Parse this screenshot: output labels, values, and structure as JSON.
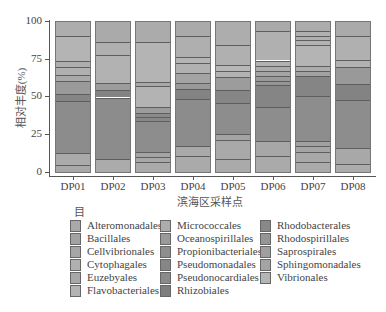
{
  "chart_data": {
    "type": "bar",
    "stacked": true,
    "title": "",
    "xlabel": "滨海区采样点",
    "ylabel": "相对丰度(%)",
    "ylim": [
      0,
      100
    ],
    "yticks": [
      0,
      25,
      50,
      75,
      100
    ],
    "grid": false,
    "legend_title": "目",
    "legend_position": "bottom",
    "categories": [
      "DP01",
      "DP02",
      "DP03",
      "DP04",
      "DP05",
      "DP06",
      "DP07",
      "DP08"
    ],
    "segment_boundaries_percent_bottom_to_top": {
      "DP01": [
        0,
        5,
        13,
        48,
        52.5,
        61,
        65,
        70,
        74,
        91,
        100
      ],
      "DP02": [
        0,
        9.5,
        50,
        55,
        59.5,
        78,
        86.5,
        100
      ],
      "DP03": [
        0,
        7,
        10.5,
        14,
        34.5,
        37,
        40,
        43.5,
        57.5,
        60.5,
        87,
        100
      ],
      "DP04": [
        0,
        11,
        18,
        49,
        55.5,
        59.5,
        66,
        73,
        76.5,
        90.5,
        100
      ],
      "DP05": [
        0,
        9,
        22,
        26,
        46.5,
        55,
        63.5,
        67.5,
        71.5,
        85,
        100
      ],
      "DP06": [
        0,
        11,
        21,
        44,
        58,
        61,
        64.5,
        67.5,
        71,
        74.5,
        94,
        100
      ],
      "DP07": [
        0,
        7,
        14,
        18,
        21,
        51,
        64.5,
        67.5,
        71,
        84.5,
        88,
        91,
        94,
        100
      ],
      "DP08": [
        0,
        6,
        16.5,
        48.5,
        59,
        70,
        75,
        90.5,
        100
      ]
    },
    "series": [
      {
        "name": "Alteromonadales",
        "color": "#a9a9a9"
      },
      {
        "name": "Bacillales",
        "color": "#a2a2a2"
      },
      {
        "name": "Cellvibrionales",
        "color": "#a6a6a6"
      },
      {
        "name": "Cytophagales",
        "color": "#b0b0b0"
      },
      {
        "name": "Euzebyales",
        "color": "#a8a8a8"
      },
      {
        "name": "Flavobacteriales",
        "color": "#b3b3b3"
      },
      {
        "name": "Micrococcales",
        "color": "#acacac"
      },
      {
        "name": "Oceanospirillales",
        "color": "#9a9a9a"
      },
      {
        "name": "Propionibacteriales",
        "color": "#8e8e8e"
      },
      {
        "name": "Pseudomonadales",
        "color": "#868686"
      },
      {
        "name": "Pseudonocardiales",
        "color": "#8a8a8a"
      },
      {
        "name": "Rhizobiales",
        "color": "#7e7e7e"
      },
      {
        "name": "Rhodobacterales",
        "color": "#888888"
      },
      {
        "name": "Rhodospirillales",
        "color": "#959595"
      },
      {
        "name": "Saprospirales",
        "color": "#9f9f9f"
      },
      {
        "name": "Sphingomonadales",
        "color": "#a4a4a4"
      },
      {
        "name": "Vibrionales",
        "color": "#b5b5b5"
      }
    ]
  },
  "axes": {
    "ylabel": "相对丰度(%)",
    "xlabel": "滨海区采样点",
    "yticks": [
      "0",
      "25",
      "50",
      "75",
      "100"
    ],
    "xticks": [
      "DP01",
      "DP02",
      "DP03",
      "DP04",
      "DP05",
      "DP06",
      "DP07",
      "DP08"
    ]
  },
  "legend": {
    "title": "目",
    "columns": [
      [
        "Alteromonadales",
        "Bacillales",
        "Cellvibrionales",
        "Cytophagales",
        "Euzebyales",
        "Flavobacteriales"
      ],
      [
        "Micrococcales",
        "Oceanospirillales",
        "Propionibacteriales",
        "Pseudomonadales",
        "Pseudonocardiales",
        "Rhizobiales"
      ],
      [
        "Rhodobacterales",
        "Rhodospirillales",
        "Saprospirales",
        "Sphingomonadales",
        "Vibrionales"
      ]
    ],
    "swatch_colors": [
      [
        "#a9a9a9",
        "#a2a2a2",
        "#a6a6a6",
        "#b0b0b0",
        "#a8a8a8",
        "#b3b3b3"
      ],
      [
        "#acacac",
        "#9a9a9a",
        "#8e8e8e",
        "#868686",
        "#8a8a8a",
        "#7e7e7e"
      ],
      [
        "#888888",
        "#959595",
        "#9f9f9f",
        "#a4a4a4",
        "#b5b5b5"
      ]
    ]
  },
  "segment_shades": {
    "DP01": [
      "#a8a8a8",
      "#aaaaaa",
      "#8c8c8c",
      "#858585",
      "#9a9a9a",
      "#a9a9a9",
      "#b0b0b0",
      "#aeaeae",
      "#b4b4b4",
      "#adadad"
    ],
    "DP02": [
      "#ababab",
      "#8c8c8c",
      "#838383",
      "#9c9c9c",
      "#b2b2b2",
      "#b0b0b0",
      "#aaaaaa"
    ],
    "DP03": [
      "#aaaaaa",
      "#a7a7a7",
      "#a4a4a4",
      "#8d8d8d",
      "#888888",
      "#8a8a8a",
      "#9c9c9c",
      "#b3b3b3",
      "#a8a8a8",
      "#b4b4b4",
      "#ababab"
    ],
    "DP04": [
      "#aaaaaa",
      "#a9a9a9",
      "#8c8c8c",
      "#838383",
      "#999999",
      "#a4a4a4",
      "#b1b1b1",
      "#b4b4b4",
      "#afafaf",
      "#aaaaaa"
    ],
    "DP05": [
      "#aaaaaa",
      "#a9a9a9",
      "#a4a4a4",
      "#8d8d8d",
      "#868686",
      "#9c9c9c",
      "#b3b3b3",
      "#b8b8b8",
      "#b0b0b0",
      "#adadad"
    ],
    "DP06": [
      "#aaaaaa",
      "#a7a7a7",
      "#8d8d8d",
      "#858585",
      "#959595",
      "#9a9a9a",
      "#a4a4a4",
      "#acacac",
      "#b2b2b2",
      "#b0b0b0",
      "#aaaaaa"
    ],
    "DP07": [
      "#aaaaaa",
      "#a8a8a8",
      "#a5a5a5",
      "#a1a1a1",
      "#8d8d8d",
      "#858585",
      "#a2a2a2",
      "#acacac",
      "#b4b4b4",
      "#b2b2b2",
      "#afafaf",
      "#b0b0b0",
      "#acacac"
    ],
    "DP08": [
      "#acacac",
      "#a8a8a8",
      "#8d8d8d",
      "#838383",
      "#999999",
      "#b2b2b2",
      "#b0b0b0",
      "#aaaaaa"
    ]
  }
}
